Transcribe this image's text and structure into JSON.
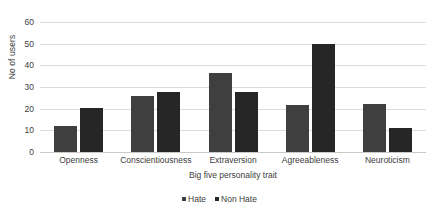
{
  "chart_data": {
    "type": "bar",
    "title": "",
    "xlabel": "Big five personality trait",
    "ylabel": "No of users",
    "categories": [
      "Openness",
      "Conscientiousness",
      "Extraversion",
      "Agreeableness",
      "Neuroticism"
    ],
    "series": [
      {
        "name": "Hate",
        "color": "#3f3f3f",
        "values": [
          12,
          26,
          36.5,
          21.5,
          22
        ]
      },
      {
        "name": "Non Hate",
        "color": "#262626",
        "values": [
          20.5,
          27.5,
          27.5,
          50,
          11
        ]
      }
    ],
    "ylim": [
      0,
      60
    ],
    "yticks": [
      0,
      10,
      20,
      30,
      40,
      50,
      60
    ],
    "ytick_labels": [
      "0",
      "10",
      "20",
      "30",
      "40",
      "50",
      "60"
    ],
    "grid": true,
    "grid_axis": "y",
    "legend_position": "bottom",
    "background": "#ffffff",
    "gridline_color": "#dcdcdc"
  }
}
